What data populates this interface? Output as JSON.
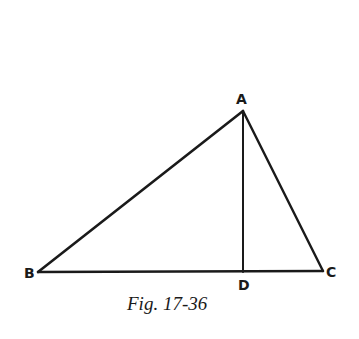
{
  "figure": {
    "caption": "Fig. 17-36",
    "stroke_color": "#1a1a1a",
    "background": "#ffffff",
    "points": {
      "A": {
        "label": "A",
        "x": 243,
        "y": 111
      },
      "B": {
        "label": "B",
        "x": 38,
        "y": 272
      },
      "C": {
        "label": "C",
        "x": 323,
        "y": 271
      },
      "D": {
        "label": "D",
        "x": 243,
        "y": 272
      }
    },
    "segments": [
      {
        "name": "AB",
        "from": "A",
        "to": "B"
      },
      {
        "name": "AC",
        "from": "A",
        "to": "C"
      },
      {
        "name": "BC",
        "from": "B",
        "to": "C"
      },
      {
        "name": "AD",
        "from": "A",
        "to": "D"
      }
    ]
  }
}
